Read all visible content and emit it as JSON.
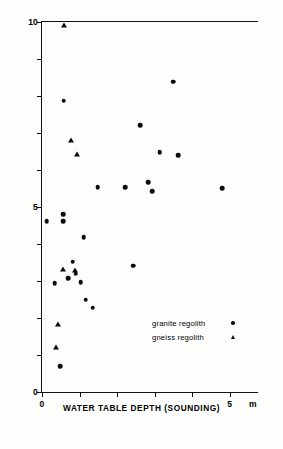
{
  "chart_data": {
    "type": "scatter",
    "title": "",
    "xlabel": "WATER TABLE DEPTH (SOUNDING)",
    "ylabel": "STANDING WATER LEVEL IN BOREHOLE, m",
    "x_unit": "m",
    "xlim": [
      0,
      5.75
    ],
    "ylim": [
      0,
      10
    ],
    "xticks": [
      0,
      1,
      2,
      3,
      4,
      5
    ],
    "xtick_labels": [
      "0",
      "",
      "",
      "",
      "",
      "5"
    ],
    "yticks": [
      0,
      1,
      2,
      3,
      4,
      5,
      6,
      7,
      8,
      9,
      10
    ],
    "ytick_labels": [
      "0",
      "",
      "",
      "",
      "",
      "5",
      "",
      "",
      "",
      "",
      "10"
    ],
    "grid": false,
    "legend_position": "lower-right",
    "series": [
      {
        "name": "granite regolith",
        "marker": "circle",
        "color": "#0b0b0b",
        "points": [
          {
            "x": 0.58,
            "y": 7.87
          },
          {
            "x": 3.49,
            "y": 8.39
          },
          {
            "x": 2.62,
            "y": 7.21
          },
          {
            "x": 3.13,
            "y": 6.48
          },
          {
            "x": 3.63,
            "y": 6.4
          },
          {
            "x": 2.83,
            "y": 5.67
          },
          {
            "x": 1.48,
            "y": 5.53
          },
          {
            "x": 2.22,
            "y": 5.53
          },
          {
            "x": 2.93,
            "y": 5.43
          },
          {
            "x": 4.79,
            "y": 5.51
          },
          {
            "x": 0.56,
            "y": 4.8
          },
          {
            "x": 0.13,
            "y": 4.62
          },
          {
            "x": 0.56,
            "y": 4.62
          },
          {
            "x": 1.11,
            "y": 4.19
          },
          {
            "x": 2.43,
            "y": 3.41
          },
          {
            "x": 0.82,
            "y": 3.52
          },
          {
            "x": 0.9,
            "y": 3.2
          },
          {
            "x": 0.69,
            "y": 3.07
          },
          {
            "x": 1.03,
            "y": 2.96
          },
          {
            "x": 0.34,
            "y": 2.94
          },
          {
            "x": 1.16,
            "y": 2.5
          },
          {
            "x": 1.35,
            "y": 2.28
          },
          {
            "x": 0.48,
            "y": 0.7
          }
        ]
      },
      {
        "name": "gneiss regolith",
        "marker": "triangle",
        "color": "#0b0b0b",
        "points": [
          {
            "x": 0.58,
            "y": 9.92
          },
          {
            "x": 0.77,
            "y": 6.8
          },
          {
            "x": 0.93,
            "y": 6.43
          },
          {
            "x": 0.56,
            "y": 3.33
          },
          {
            "x": 0.87,
            "y": 3.3
          },
          {
            "x": 0.42,
            "y": 1.83
          },
          {
            "x": 0.37,
            "y": 1.21
          }
        ]
      }
    ]
  },
  "legend": {
    "items": [
      {
        "label": "granite regolith",
        "marker": "circle"
      },
      {
        "label": "gneiss  regolith",
        "marker": "triangle"
      }
    ]
  }
}
